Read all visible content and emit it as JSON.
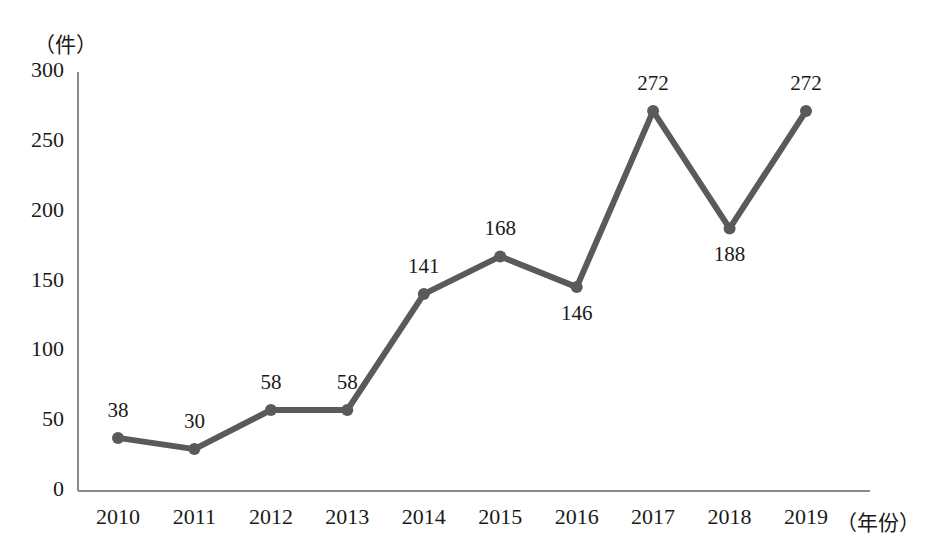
{
  "chart_data": {
    "type": "line",
    "title": "",
    "xlabel": "（年份）",
    "ylabel": "（件）",
    "categories": [
      "2010",
      "2011",
      "2012",
      "2013",
      "2014",
      "2015",
      "2016",
      "2017",
      "2018",
      "2019"
    ],
    "values": [
      38,
      30,
      58,
      58,
      141,
      168,
      146,
      272,
      188,
      272
    ],
    "value_labels": [
      "38",
      "30",
      "58",
      "58",
      "141",
      "168",
      "146",
      "272",
      "188",
      "272"
    ],
    "label_positions": [
      "above",
      "above",
      "above",
      "above",
      "above",
      "above",
      "below",
      "above",
      "below",
      "above"
    ],
    "ylim": [
      0,
      300
    ],
    "yticks": [
      "0",
      "50",
      "100",
      "150",
      "200",
      "250",
      "300"
    ],
    "ytick_values": [
      0,
      50,
      100,
      150,
      200,
      250,
      300
    ],
    "grid": false,
    "legend": "none",
    "series_color": "#5a5a5a",
    "axis_color": "#808080",
    "marker": "circle",
    "marker_size": 9
  },
  "axes": {
    "y_unit": "（件）",
    "x_unit": "（年份）"
  }
}
